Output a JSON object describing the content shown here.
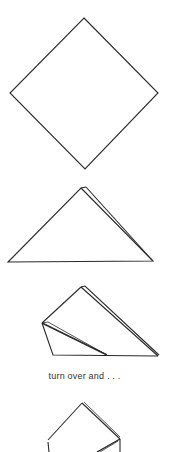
{
  "diagram": {
    "title_fragment": "(cut off)",
    "steps": [
      {
        "id": 1,
        "shape": "diamond",
        "description": "square sheet oriented as a diamond"
      },
      {
        "id": 2,
        "shape": "triangle",
        "description": "folded in half into a triangle (double layer)"
      },
      {
        "id": 3,
        "shape": "folded-triangle",
        "description": "left corner folded up along a diagonal"
      },
      {
        "id": 4,
        "shape": "partial",
        "description": "result after turning over (cut off at bottom)"
      }
    ],
    "caption": "turn over and . . .",
    "stroke_color": "#2a2a2a",
    "background": "#ffffff"
  }
}
